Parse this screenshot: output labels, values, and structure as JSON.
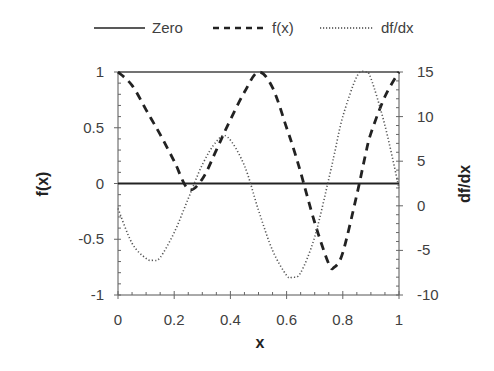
{
  "chart_data": {
    "type": "line",
    "title": "",
    "xlabel": "x",
    "ylabel": "f(x)",
    "y2label": "df/dx",
    "xlim": [
      0,
      1
    ],
    "ylim": [
      -1,
      1
    ],
    "y2lim": [
      -10,
      15
    ],
    "x_ticks": [
      "0",
      "0.2",
      "0.4",
      "0.6",
      "0.8",
      "1"
    ],
    "y_ticks": [
      "1",
      "0.5",
      "0",
      "-0.5",
      "-1"
    ],
    "y2_ticks": [
      "15",
      "10",
      "5",
      "0",
      "-5",
      "-10"
    ],
    "grid": false,
    "legend_position": "top",
    "legend": [
      "Zero",
      "f(x)",
      "df/dx"
    ],
    "x": [
      0,
      0.05,
      0.1,
      0.125,
      0.15,
      0.2,
      0.25,
      0.3,
      0.35,
      0.39,
      0.45,
      0.5,
      0.55,
      0.6,
      0.62,
      0.65,
      0.7,
      0.75,
      0.77,
      0.8,
      0.85,
      0.88,
      0.9,
      0.95,
      1.0
    ],
    "series": [
      {
        "name": "Zero",
        "axis": "left",
        "style": "solid",
        "values": [
          0,
          0,
          0,
          0,
          0,
          0,
          0,
          0,
          0,
          0,
          0,
          0,
          0,
          0,
          0,
          0,
          0,
          0,
          0,
          0,
          0,
          0,
          0,
          0,
          0
        ]
      },
      {
        "name": "f(x)",
        "axis": "left",
        "style": "dashed",
        "values": [
          1.0,
          0.88,
          0.66,
          0.55,
          0.44,
          0.2,
          -0.05,
          0.04,
          0.3,
          0.52,
          0.82,
          1.0,
          0.86,
          0.5,
          0.35,
          0.1,
          -0.35,
          -0.72,
          -0.75,
          -0.62,
          -0.1,
          0.25,
          0.45,
          0.78,
          1.0
        ]
      },
      {
        "name": "df/dx",
        "axis": "right",
        "style": "dotted",
        "values": [
          -0.3,
          -4.2,
          -5.9,
          -6.1,
          -5.8,
          -3.0,
          0.8,
          4.6,
          7.2,
          7.7,
          4.5,
          -0.5,
          -5.0,
          -7.8,
          -8.0,
          -7.5,
          -3.5,
          3.0,
          5.8,
          10.0,
          14.5,
          15.0,
          14.3,
          9.0,
          2.0
        ]
      }
    ]
  },
  "legend": {
    "items": [
      {
        "label": "Zero"
      },
      {
        "label": "f(x)"
      },
      {
        "label": "df/dx"
      }
    ]
  },
  "axes": {
    "x_title": "x",
    "y_title": "f(x)",
    "y2_title": "df/dx"
  }
}
